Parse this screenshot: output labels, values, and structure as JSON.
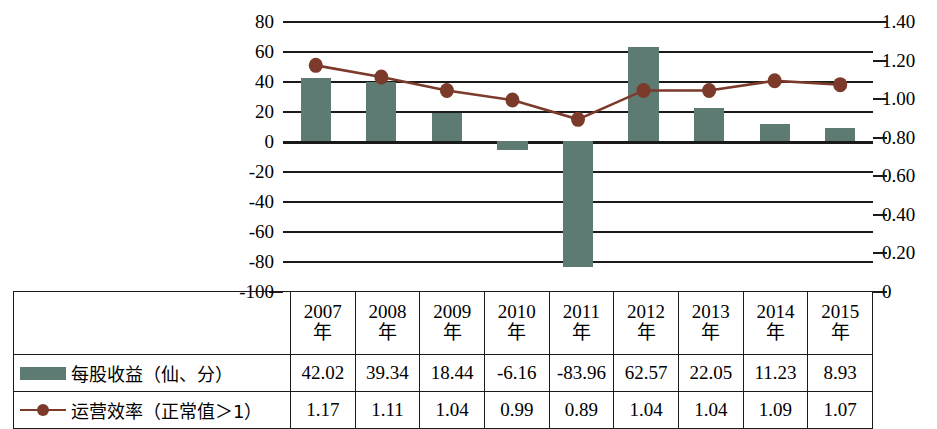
{
  "chart_data": {
    "type": "bar",
    "title": "",
    "xlabel": "",
    "categories": [
      "2007年",
      "2008年",
      "2009年",
      "2010年",
      "2011年",
      "2012年",
      "2013年",
      "2014年",
      "2015年"
    ],
    "category_lines": [
      [
        "2007",
        "年"
      ],
      [
        "2008",
        "年"
      ],
      [
        "2009",
        "年"
      ],
      [
        "2010",
        "年"
      ],
      [
        "2011",
        "年"
      ],
      [
        "2012",
        "年"
      ],
      [
        "2013",
        "年"
      ],
      [
        "2014",
        "年"
      ],
      [
        "2015",
        "年"
      ]
    ],
    "grid": true,
    "legend_position": "table-below",
    "series": [
      {
        "name": "每股收益（仙、分）",
        "type": "bar",
        "axis": "left",
        "color": "#5d7a73",
        "values": [
          42.02,
          39.34,
          18.44,
          -6.16,
          -83.96,
          62.57,
          22.05,
          11.23,
          8.93
        ],
        "value_labels": [
          "42.02",
          "39.34",
          "18.44",
          "-6.16",
          "-83.96",
          "62.57",
          "22.05",
          "11.23",
          "8.93"
        ]
      },
      {
        "name": "运营效率（正常值＞1）",
        "type": "line",
        "axis": "right",
        "color": "#7b3a2a",
        "values": [
          1.17,
          1.11,
          1.04,
          0.99,
          0.89,
          1.04,
          1.04,
          1.09,
          1.07
        ],
        "value_labels": [
          "1.17",
          "1.11",
          "1.04",
          "0.99",
          "0.89",
          "1.04",
          "1.04",
          "1.09",
          "1.07"
        ]
      }
    ],
    "left_axis": {
      "label": "",
      "min": -100,
      "max": 80,
      "step": 20,
      "ticks": [
        "80",
        "60",
        "40",
        "20",
        "0",
        "-20",
        "-40",
        "-60",
        "-80",
        "-100"
      ],
      "tick_values": [
        80,
        60,
        40,
        20,
        0,
        -20,
        -40,
        -60,
        -80,
        -100
      ]
    },
    "right_axis": {
      "label": "",
      "min": 0,
      "max": 1.4,
      "step": 0.2,
      "ticks": [
        "1.40",
        "1.20",
        "1.00",
        "0.80",
        "0.60",
        "0.40",
        "0.20",
        "0"
      ],
      "tick_values": [
        1.4,
        1.2,
        1.0,
        0.8,
        0.6,
        0.4,
        0.2,
        0
      ]
    }
  },
  "table": {
    "legend_rows": [
      {
        "marker": "bar-swatch",
        "label": "每股收益（仙、分）"
      },
      {
        "marker": "line-swatch",
        "label": "运营效率（正常值＞1）"
      }
    ]
  },
  "colors": {
    "bar": "#5d7a73",
    "line": "#7b3a2a",
    "axis": "#1a1a1a",
    "background": "#ffffff"
  }
}
